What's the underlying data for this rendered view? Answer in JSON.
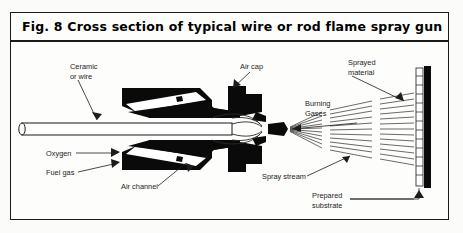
{
  "figure": {
    "title": "Fig. 8  Cross section of typical wire or rod flame spray gun",
    "caption_number": "Fig. 8",
    "border_color": "#1a1a1a",
    "background_color": "#fdfdfb",
    "ink_color": "#000000"
  },
  "labels": {
    "ceramic_or_wire_line1": "Ceramic",
    "ceramic_or_wire_line2": "or wire",
    "air_cap": "Air cap",
    "sprayed_material_line1": "Sprayed",
    "sprayed_material_line2": "material",
    "burning_gases_line1": "Burning",
    "burning_gases_line2": "Gases",
    "oxygen": "Oxygen",
    "fuel_gas": "Fuel gas",
    "air_channel": "Air channel",
    "spray_stream": "Spray stream",
    "prepared_substrate_line1": "Prepared",
    "prepared_substrate_line2": "substrate"
  },
  "diagram": {
    "type": "technical-cross-section",
    "subject": "wire or rod flame spray gun",
    "components": [
      "ceramic or wire rod",
      "oxygen inlet",
      "fuel gas inlet",
      "air channel",
      "air cap",
      "burning gases",
      "spray stream",
      "sprayed material coating",
      "prepared substrate"
    ]
  }
}
